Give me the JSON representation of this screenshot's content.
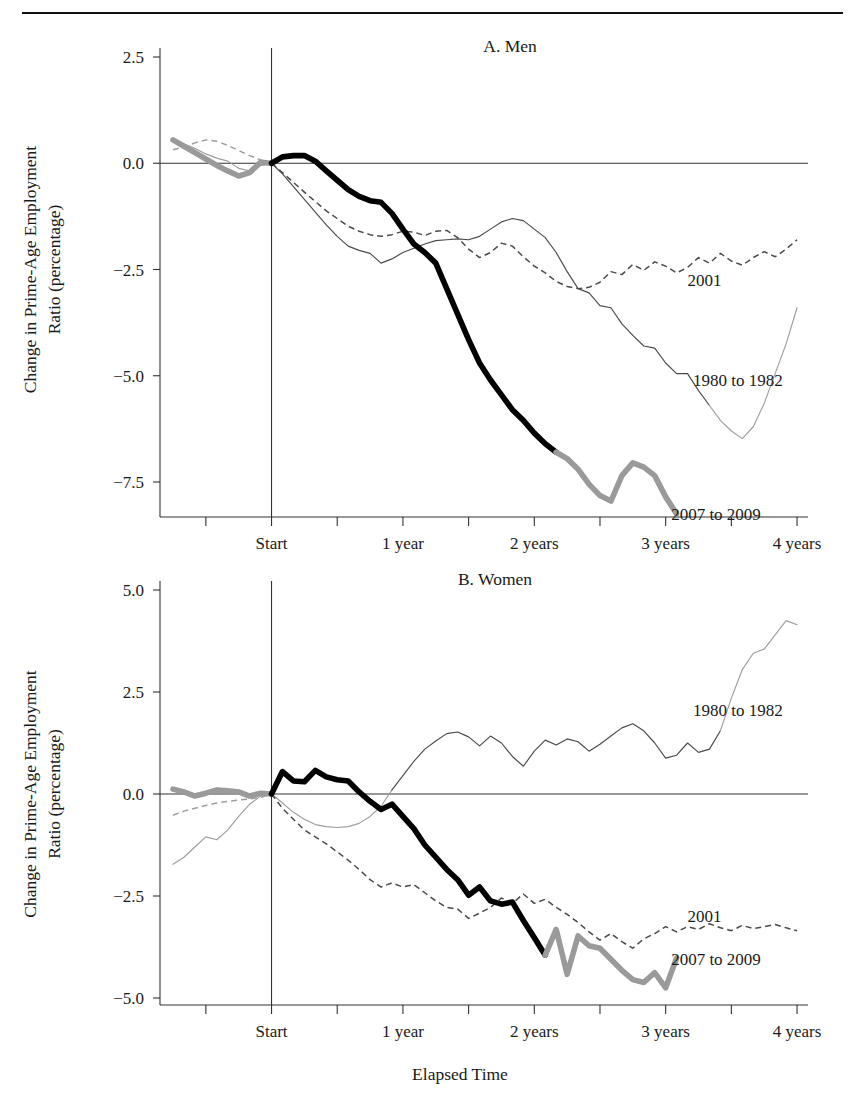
{
  "figure": {
    "xlabel": "Elapsed Time",
    "ylabel_line1": "Change in Prime-Age Employment",
    "ylabel_line2": "Ratio (percentage)"
  },
  "chart_data": [
    {
      "type": "line",
      "title": "A. Men",
      "xlabel": "Elapsed Time",
      "ylabel": "Change in Prime-Age Employment Ratio (percentage)",
      "grid": false,
      "legend_position": "inline-right-annotations",
      "xticklabels": [
        "Start",
        "1 year",
        "2 years",
        "3 years",
        "4 years"
      ],
      "xtickvalues": [
        0,
        12,
        24,
        36,
        48
      ],
      "xlim": [
        -9,
        49
      ],
      "yticklabels": [
        "2.5",
        "0.0",
        "-2.5",
        "-5.0",
        "-7.5"
      ],
      "ytickvalues": [
        2.5,
        0.0,
        -2.5,
        -5.0,
        -7.5
      ],
      "ylim": [
        -9.0,
        3.1
      ],
      "series": [
        {
          "name": "1980 to 1982",
          "style": "thin-solid",
          "label_x": 38.5,
          "label_y": -5.1,
          "x": [
            -9,
            -8,
            -7,
            -6,
            -5,
            -4,
            -3,
            -2,
            -1,
            0,
            1,
            2,
            3,
            4,
            5,
            6,
            7,
            8,
            9,
            10,
            11,
            12,
            13,
            14,
            15,
            16,
            17,
            18,
            19,
            20,
            21,
            22,
            23,
            24,
            25,
            26,
            27,
            28,
            29,
            30,
            31,
            32,
            33,
            34,
            35,
            36,
            37,
            38,
            39,
            40,
            41,
            42,
            43,
            44,
            45,
            46,
            47,
            48
          ],
          "y": [
            0.52,
            0.45,
            0.35,
            0.22,
            0.12,
            0.05,
            -0.12,
            -0.18,
            -0.05,
            0.0,
            -0.25,
            -0.55,
            -0.85,
            -1.15,
            -1.45,
            -1.72,
            -1.95,
            -2.05,
            -2.12,
            -2.35,
            -2.25,
            -2.1,
            -2.0,
            -1.9,
            -1.82,
            -1.8,
            -1.78,
            -1.8,
            -1.72,
            -1.55,
            -1.38,
            -1.3,
            -1.35,
            -1.55,
            -1.75,
            -2.1,
            -2.55,
            -2.95,
            -3.05,
            -3.35,
            -3.4,
            -3.78,
            -4.05,
            -4.3,
            -4.35,
            -4.7,
            -4.95,
            -4.95,
            -5.35,
            -5.7,
            -6.05,
            -6.3,
            -6.48,
            -6.2,
            -5.65,
            -4.95,
            -4.25,
            -3.4
          ]
        },
        {
          "name": "2001",
          "style": "dashed",
          "label_x": 38.0,
          "label_y": -2.75,
          "x": [
            -9,
            -8,
            -7,
            -6,
            -5,
            -4,
            -3,
            -2,
            -1,
            0,
            1,
            2,
            3,
            4,
            5,
            6,
            7,
            8,
            9,
            10,
            11,
            12,
            13,
            14,
            15,
            16,
            17,
            18,
            19,
            20,
            21,
            22,
            23,
            24,
            25,
            26,
            27,
            28,
            29,
            30,
            31,
            32,
            33,
            34,
            35,
            36,
            37,
            38,
            39,
            40,
            41,
            42,
            43,
            44,
            45,
            46,
            47,
            48
          ],
          "y": [
            0.32,
            0.38,
            0.48,
            0.55,
            0.52,
            0.42,
            0.3,
            0.18,
            0.08,
            0.0,
            -0.22,
            -0.45,
            -0.68,
            -0.9,
            -1.12,
            -1.3,
            -1.48,
            -1.6,
            -1.68,
            -1.72,
            -1.68,
            -1.6,
            -1.62,
            -1.7,
            -1.6,
            -1.58,
            -1.75,
            -2.02,
            -2.22,
            -2.1,
            -1.88,
            -1.95,
            -2.2,
            -2.42,
            -2.58,
            -2.78,
            -2.9,
            -2.95,
            -2.92,
            -2.8,
            -2.55,
            -2.62,
            -2.38,
            -2.52,
            -2.32,
            -2.42,
            -2.58,
            -2.45,
            -2.22,
            -2.35,
            -2.12,
            -2.3,
            -2.4,
            -2.22,
            -2.08,
            -2.2,
            -2.02,
            -1.8
          ]
        },
        {
          "name": "2007 to 2009",
          "style": "thick",
          "label_x": 36.5,
          "label_y": -8.25,
          "x": [
            -9,
            -8,
            -7,
            -6,
            -5,
            -4,
            -3,
            -2,
            -1,
            0,
            1,
            2,
            3,
            4,
            5,
            6,
            7,
            8,
            9,
            10,
            11,
            12,
            13,
            14,
            15,
            16,
            17,
            18,
            19,
            20,
            21,
            22,
            23,
            24,
            25,
            26,
            27,
            28,
            29,
            30,
            31,
            32,
            33,
            34,
            35,
            36,
            37
          ],
          "y": [
            0.55,
            0.4,
            0.25,
            0.1,
            -0.05,
            -0.18,
            -0.3,
            -0.22,
            0.02,
            0.0,
            0.15,
            0.18,
            0.18,
            0.05,
            -0.18,
            -0.4,
            -0.62,
            -0.78,
            -0.88,
            -0.92,
            -1.18,
            -1.55,
            -1.9,
            -2.1,
            -2.35,
            -2.95,
            -3.55,
            -4.15,
            -4.7,
            -5.1,
            -5.45,
            -5.8,
            -6.05,
            -6.35,
            -6.6,
            -6.8,
            -6.95,
            -7.2,
            -7.55,
            -7.82,
            -7.95,
            -7.35,
            -7.05,
            -7.15,
            -7.35,
            -7.85,
            -8.25
          ],
          "split_index": 35
        }
      ]
    },
    {
      "type": "line",
      "title": "B. Women",
      "xlabel": "Elapsed Time",
      "ylabel": "Change in Prime-Age Employment Ratio (percentage)",
      "grid": false,
      "legend_position": "inline-right-annotations",
      "xticklabels": [
        "Start",
        "1 year",
        "2 years",
        "3 years",
        "4 years"
      ],
      "xtickvalues": [
        0,
        12,
        24,
        36,
        48
      ],
      "xlim": [
        -9,
        49
      ],
      "yticklabels": [
        "5.0",
        "2.5",
        "0.0",
        "-2.5",
        "-5.0"
      ],
      "ytickvalues": [
        5.0,
        2.5,
        0.0,
        -2.5,
        -5.0
      ],
      "ylim": [
        -5.5,
        5.6
      ],
      "series": [
        {
          "name": "1980 to 1982",
          "style": "thin-solid",
          "label_x": 38.5,
          "label_y": 2.05,
          "x": [
            -9,
            -8,
            -7,
            -6,
            -5,
            -4,
            -3,
            -2,
            -1,
            0,
            1,
            2,
            3,
            4,
            5,
            6,
            7,
            8,
            9,
            10,
            11,
            12,
            13,
            14,
            15,
            16,
            17,
            18,
            19,
            20,
            21,
            22,
            23,
            24,
            25,
            26,
            27,
            28,
            29,
            30,
            31,
            32,
            33,
            34,
            35,
            36,
            37,
            38,
            39,
            40,
            41,
            42,
            43,
            44,
            45,
            46,
            47,
            48
          ],
          "y": [
            -1.72,
            -1.55,
            -1.3,
            -1.05,
            -1.12,
            -0.88,
            -0.55,
            -0.25,
            -0.05,
            0.0,
            -0.22,
            -0.45,
            -0.62,
            -0.75,
            -0.8,
            -0.82,
            -0.8,
            -0.72,
            -0.55,
            -0.3,
            0.1,
            0.45,
            0.8,
            1.1,
            1.3,
            1.48,
            1.52,
            1.4,
            1.18,
            1.42,
            1.25,
            0.92,
            0.68,
            1.05,
            1.32,
            1.2,
            1.35,
            1.28,
            1.05,
            1.22,
            1.42,
            1.62,
            1.72,
            1.55,
            1.25,
            0.88,
            0.95,
            1.25,
            1.02,
            1.1,
            1.55,
            2.35,
            3.05,
            3.45,
            3.55,
            3.9,
            4.25,
            4.15
          ]
        },
        {
          "name": "2001",
          "style": "dashed",
          "label_x": 38.0,
          "label_y": -3.0,
          "x": [
            -9,
            -8,
            -7,
            -6,
            -5,
            -4,
            -3,
            -2,
            -1,
            0,
            1,
            2,
            3,
            4,
            5,
            6,
            7,
            8,
            9,
            10,
            11,
            12,
            13,
            14,
            15,
            16,
            17,
            18,
            19,
            20,
            21,
            22,
            23,
            24,
            25,
            26,
            27,
            28,
            29,
            30,
            31,
            32,
            33,
            34,
            35,
            36,
            37,
            38,
            39,
            40,
            41,
            42,
            43,
            44,
            45,
            46,
            47,
            48
          ],
          "y": [
            -0.52,
            -0.42,
            -0.35,
            -0.28,
            -0.22,
            -0.18,
            -0.15,
            -0.12,
            -0.08,
            0.0,
            -0.35,
            -0.62,
            -0.88,
            -1.05,
            -1.22,
            -1.42,
            -1.62,
            -1.85,
            -2.1,
            -2.28,
            -2.18,
            -2.28,
            -2.22,
            -2.42,
            -2.62,
            -2.78,
            -2.82,
            -3.05,
            -2.92,
            -2.78,
            -2.55,
            -2.68,
            -2.45,
            -2.68,
            -2.58,
            -2.78,
            -2.95,
            -3.15,
            -3.38,
            -3.58,
            -3.42,
            -3.62,
            -3.78,
            -3.55,
            -3.42,
            -3.25,
            -3.38,
            -3.25,
            -3.32,
            -3.18,
            -3.28,
            -3.35,
            -3.22,
            -3.3,
            -3.25,
            -3.2,
            -3.28,
            -3.35
          ]
        },
        {
          "name": "2007 to 2009",
          "style": "thick",
          "label_x": 36.5,
          "label_y": -4.05,
          "x": [
            -9,
            -8,
            -7,
            -6,
            -5,
            -4,
            -3,
            -2,
            -1,
            0,
            1,
            2,
            3,
            4,
            5,
            6,
            7,
            8,
            9,
            10,
            11,
            12,
            13,
            14,
            15,
            16,
            17,
            18,
            19,
            20,
            21,
            22,
            23,
            24,
            25,
            26,
            27,
            28,
            29,
            30,
            31,
            32,
            33,
            34,
            35,
            36,
            37
          ],
          "y": [
            0.12,
            0.05,
            -0.05,
            0.02,
            0.1,
            0.08,
            0.05,
            -0.05,
            0.02,
            0.0,
            0.55,
            0.32,
            0.3,
            0.58,
            0.42,
            0.35,
            0.32,
            0.05,
            -0.18,
            -0.38,
            -0.25,
            -0.55,
            -0.85,
            -1.25,
            -1.55,
            -1.85,
            -2.1,
            -2.48,
            -2.28,
            -2.62,
            -2.7,
            -2.65,
            -3.1,
            -3.52,
            -3.95,
            -3.32,
            -4.42,
            -3.48,
            -3.72,
            -3.78,
            -4.05,
            -4.32,
            -4.55,
            -4.62,
            -4.38,
            -4.75,
            -4.02
          ],
          "split_index": 34
        }
      ]
    }
  ]
}
